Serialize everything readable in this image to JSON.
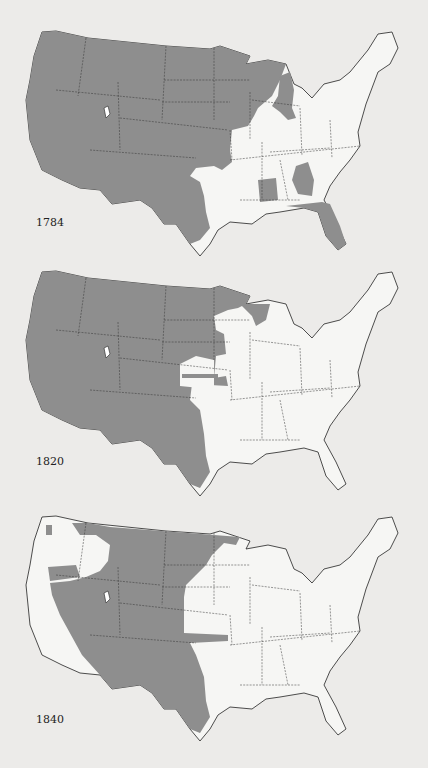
{
  "legend": {
    "shaded": "Unsettled area",
    "unshaded": "Settled area"
  },
  "colors": {
    "background": "#ecebe9",
    "land": "#f6f6f4",
    "shaded": "#8e8e8e",
    "outline": "#222222"
  },
  "maps": [
    {
      "year": "1784"
    },
    {
      "year": "1820"
    },
    {
      "year": "1840"
    }
  ]
}
